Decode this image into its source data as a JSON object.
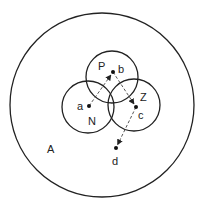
{
  "diagram": {
    "type": "venn-with-paths",
    "colors": {
      "stroke": "#222222",
      "path": "#444444",
      "background": "#ffffff"
    },
    "regions": [
      {
        "id": "A",
        "label": "A",
        "cx": 102,
        "cy": 105,
        "r": 92,
        "label_x": 47,
        "label_y": 153
      },
      {
        "id": "P",
        "label": "P",
        "cx": 112,
        "cy": 77,
        "r": 26,
        "label_x": 98,
        "label_y": 70
      },
      {
        "id": "N",
        "label": "N",
        "cx": 88,
        "cy": 107,
        "r": 26,
        "label_x": 88,
        "label_y": 125
      },
      {
        "id": "Z",
        "label": "Z",
        "cx": 134,
        "cy": 105,
        "r": 26,
        "label_x": 140,
        "label_y": 101
      }
    ],
    "points": [
      {
        "id": "a",
        "label": "a",
        "x": 89,
        "y": 106,
        "label_x": 77,
        "label_y": 110
      },
      {
        "id": "b",
        "label": "b",
        "x": 113,
        "y": 72,
        "label_x": 118,
        "label_y": 73
      },
      {
        "id": "c",
        "label": "c",
        "x": 136,
        "y": 107,
        "label_x": 138,
        "label_y": 119
      },
      {
        "id": "d",
        "label": "d",
        "x": 116,
        "y": 148,
        "label_x": 112,
        "label_y": 165
      }
    ],
    "arrows": [
      {
        "from": "a",
        "to": "b"
      },
      {
        "from": "b",
        "to": "c"
      },
      {
        "from": "c",
        "to": "d"
      }
    ]
  }
}
